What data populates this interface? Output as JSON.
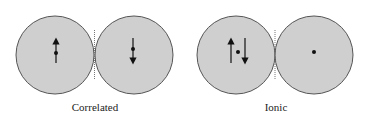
{
  "colors": {
    "atom_fill": "#cfcfcf",
    "atom_stroke": "#555555",
    "ink": "#111111"
  },
  "panels": [
    {
      "label": "Correlated",
      "atoms": [
        {
          "cx": 55,
          "cy": 55,
          "r": 39,
          "electron": {
            "dot": [
              56,
              53
            ],
            "spin": "up",
            "x": 56,
            "y1": 63,
            "y2": 39
          }
        },
        {
          "cx": 134,
          "cy": 55,
          "r": 39,
          "electron": {
            "dot": [
              133,
              49
            ],
            "spin": "down",
            "x": 133,
            "y1": 38,
            "y2": 63
          }
        }
      ]
    },
    {
      "label": "Ionic",
      "atoms": [
        {
          "cx": 236,
          "cy": 55,
          "r": 39,
          "electrons": [
            {
              "spin": "up",
              "x": 231,
              "y1": 63,
              "y2": 39
            },
            {
              "spin": "down",
              "x": 245,
              "y1": 38,
              "y2": 63
            }
          ],
          "dot": [
            238,
            52
          ]
        },
        {
          "cx": 314,
          "cy": 55,
          "r": 39,
          "dot": [
            314,
            52
          ]
        }
      ]
    }
  ]
}
